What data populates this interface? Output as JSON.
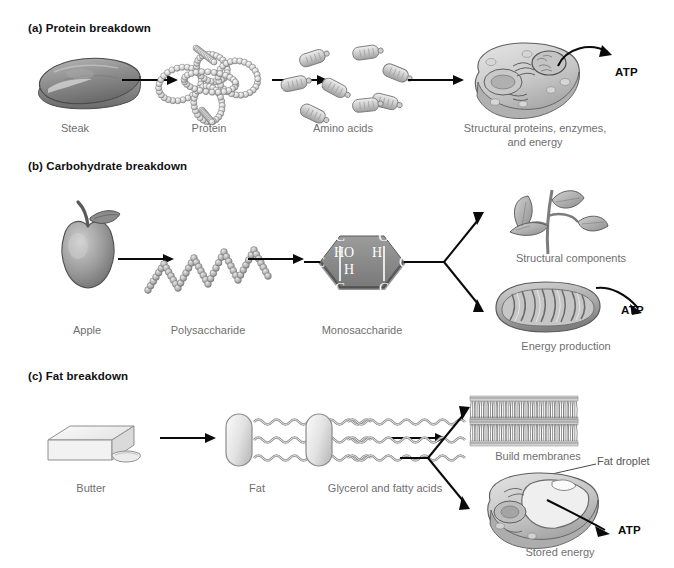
{
  "figure": {
    "background": "#ffffff",
    "label_color": "#6f6f6f",
    "heading_color": "#111111",
    "arrow_color": "#0a0a0a"
  },
  "sections": [
    {
      "id": "a",
      "heading": "(a) Protein breakdown",
      "steps": [
        {
          "name": "steak",
          "label": "Steak",
          "icon": "steak-illustration"
        },
        {
          "name": "protein",
          "label": "Protein",
          "icon": "protein-tangle-illustration"
        },
        {
          "name": "amino-acids",
          "label": "Amino acids",
          "icon": "amino-acid-capsules-illustration"
        },
        {
          "name": "cell",
          "label": "Structural proteins, enzymes, and energy",
          "label_line1": "Structural proteins, enzymes,",
          "label_line2": "and energy",
          "icon": "animal-cell-illustration"
        }
      ],
      "product": "ATP"
    },
    {
      "id": "b",
      "heading": "(b) Carbohydrate breakdown",
      "steps": [
        {
          "name": "apple",
          "label": "Apple",
          "icon": "apple-illustration"
        },
        {
          "name": "polysaccharide",
          "label": "Polysaccharide",
          "icon": "polysaccharide-chain-illustration"
        },
        {
          "name": "monosaccharide",
          "label": "Monosaccharide",
          "icon": "monosaccharide-hexagon-illustration"
        }
      ],
      "branches": [
        {
          "name": "structural-components",
          "label": "Structural components",
          "icon": "plant-sprout-illustration"
        },
        {
          "name": "energy-production",
          "label": "Energy production",
          "icon": "mitochondrion-illustration",
          "product": "ATP"
        }
      ],
      "molecule": {
        "vertices": [
          "C",
          "O",
          "C",
          "C",
          "C",
          "C"
        ],
        "inner_labels": [
          "HO",
          "H",
          "H"
        ]
      }
    },
    {
      "id": "c",
      "heading": "(c) Fat breakdown",
      "steps": [
        {
          "name": "butter",
          "label": "Butter",
          "icon": "butter-block-illustration"
        },
        {
          "name": "fat",
          "label": "Fat",
          "icon": "triglyceride-illustration"
        },
        {
          "name": "glycerol-fatty-acids",
          "label": "Glycerol and fatty acids",
          "icon": "glycerol-fatty-acids-illustration"
        }
      ],
      "branches": [
        {
          "name": "build-membranes",
          "label": "Build membranes",
          "icon": "lipid-bilayer-illustration"
        },
        {
          "name": "stored-energy",
          "label": "Stored energy",
          "icon": "fat-cell-illustration",
          "product": "ATP",
          "annotation": "Fat droplet"
        }
      ]
    }
  ]
}
